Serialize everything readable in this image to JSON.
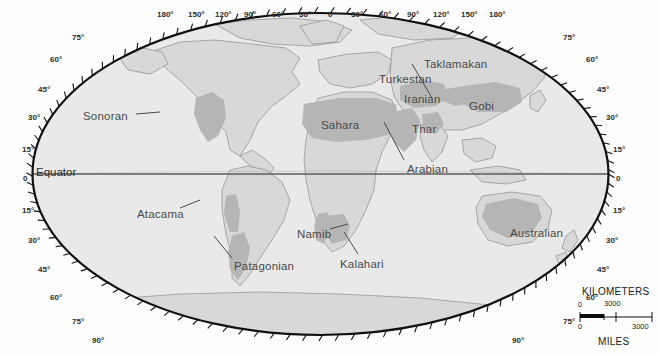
{
  "map": {
    "title": "World Deserts Map",
    "projection": "oval / elliptical world projection",
    "equator_label": "Equator",
    "background_color": "#ffffff",
    "ocean_color": "#e8e8e8",
    "land_color": "#d6d6d6",
    "desert_color": "#b3b3b3",
    "outline_color": "#111111",
    "graticule_color": "#6f6f6f"
  },
  "deserts": [
    {
      "name": "Sonoran",
      "label_x": 83,
      "label_y": 110,
      "leader": true
    },
    {
      "name": "Sahara",
      "label_x": 321,
      "label_y": 119,
      "leader": false
    },
    {
      "name": "Turkestan",
      "label_x": 379,
      "label_y": 73,
      "leader": false
    },
    {
      "name": "Taklamakan",
      "label_x": 424,
      "label_y": 58,
      "leader": true
    },
    {
      "name": "Iranian",
      "label_x": 404,
      "label_y": 93,
      "leader": false
    },
    {
      "name": "Gobi",
      "label_x": 469,
      "label_y": 100,
      "leader": false
    },
    {
      "name": "Thar",
      "label_x": 412,
      "label_y": 123,
      "leader": false
    },
    {
      "name": "Arabian",
      "label_x": 407,
      "label_y": 163,
      "leader": true
    },
    {
      "name": "Atacama",
      "label_x": 137,
      "label_y": 208,
      "leader": true
    },
    {
      "name": "Patagonian",
      "label_x": 234,
      "label_y": 260,
      "leader": true
    },
    {
      "name": "Namib",
      "label_x": 297,
      "label_y": 228,
      "leader": true
    },
    {
      "name": "Kalahari",
      "label_x": 340,
      "label_y": 258,
      "leader": true
    },
    {
      "name": "Australian",
      "label_x": 510,
      "label_y": 227,
      "leader": false
    }
  ],
  "longitude_labels": [
    {
      "text": "180°",
      "x": 157
    },
    {
      "text": "150°",
      "x": 188
    },
    {
      "text": "120°",
      "x": 215
    },
    {
      "text": "90°",
      "x": 244
    },
    {
      "text": "60°",
      "x": 272
    },
    {
      "text": "30°",
      "x": 299
    },
    {
      "text": "0",
      "x": 328
    },
    {
      "text": "30°",
      "x": 351
    },
    {
      "text": "60°",
      "x": 379
    },
    {
      "text": "90°",
      "x": 407
    },
    {
      "text": "120°",
      "x": 433
    },
    {
      "text": "150°",
      "x": 461
    },
    {
      "text": "180°",
      "x": 489
    }
  ],
  "latitude_labels_left": [
    {
      "text": "75°",
      "x": 72,
      "y": 33
    },
    {
      "text": "60°",
      "x": 50,
      "y": 55
    },
    {
      "text": "45°",
      "x": 38,
      "y": 85
    },
    {
      "text": "30°",
      "x": 28,
      "y": 113
    },
    {
      "text": "15°",
      "x": 22,
      "y": 145
    },
    {
      "text": "0",
      "x": 23,
      "y": 174
    },
    {
      "text": "15°",
      "x": 22,
      "y": 206
    },
    {
      "text": "30°",
      "x": 28,
      "y": 236
    },
    {
      "text": "45°",
      "x": 38,
      "y": 265
    },
    {
      "text": "60°",
      "x": 50,
      "y": 293
    },
    {
      "text": "75°",
      "x": 72,
      "y": 317
    },
    {
      "text": "90°",
      "x": 92,
      "y": 336
    }
  ],
  "latitude_labels_right": [
    {
      "text": "75°",
      "x": 563,
      "y": 33
    },
    {
      "text": "60°",
      "x": 586,
      "y": 55
    },
    {
      "text": "45°",
      "x": 597,
      "y": 85
    },
    {
      "text": "30°",
      "x": 606,
      "y": 113
    },
    {
      "text": "15°",
      "x": 613,
      "y": 145
    },
    {
      "text": "0",
      "x": 616,
      "y": 174
    },
    {
      "text": "15°",
      "x": 613,
      "y": 206
    },
    {
      "text": "30°",
      "x": 606,
      "y": 236
    },
    {
      "text": "45°",
      "x": 597,
      "y": 265
    },
    {
      "text": "60°",
      "x": 586,
      "y": 293
    },
    {
      "text": "75°",
      "x": 563,
      "y": 317
    },
    {
      "text": "90°",
      "x": 512,
      "y": 336
    }
  ],
  "scale_bar": {
    "top_unit": "KILOMETERS",
    "bottom_unit": "MILES",
    "top_zero": "0",
    "top_max": "3000",
    "bottom_zero": "0",
    "bottom_max": "3000"
  }
}
